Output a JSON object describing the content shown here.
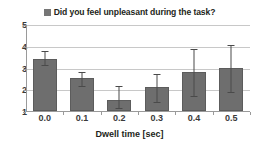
{
  "chart_data": {
    "type": "bar",
    "title": "Did you feel unpleasant during the task?",
    "xlabel": "Dwell time [sec]",
    "ylabel": "",
    "categories": [
      "0.0",
      "0.1",
      "0.2",
      "0.3",
      "0.4",
      "0.5"
    ],
    "values": [
      3.4,
      2.5,
      1.5,
      2.1,
      2.8,
      3.0
    ],
    "error_low": [
      3.15,
      2.2,
      1.2,
      1.45,
      1.75,
      1.9
    ],
    "error_high": [
      3.8,
      2.85,
      2.2,
      2.75,
      3.9,
      4.1
    ],
    "ylim": [
      1,
      5
    ],
    "yticks": [
      "5",
      "4",
      "3",
      "2",
      "1"
    ],
    "ytick_values": [
      5,
      4,
      3,
      2,
      1
    ],
    "grid": true,
    "legend": [
      "Did you feel unpleasant during the task?"
    ],
    "legend_position": "top-center",
    "bar_color": "#6e6e6e",
    "error_color": "#4a4a4a",
    "grid_color": "#c8c8c8",
    "axis_color": "#9a9a9a",
    "text_color": "#231f20",
    "background": "#ffffff"
  },
  "legend_marker": "legend-swatch-icon"
}
